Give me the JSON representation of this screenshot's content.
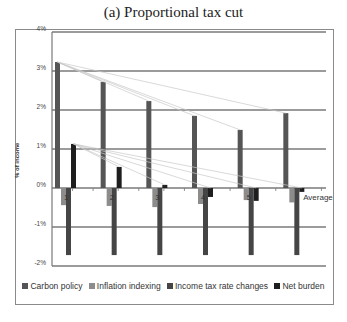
{
  "chart_data": {
    "type": "bar",
    "title": "(a) Proportional tax cut",
    "xlabel": "",
    "ylabel": "% of income",
    "ylim": [
      -0.02,
      0.04
    ],
    "yticks": [
      "4%",
      "3%",
      "2%",
      "1%",
      "0%",
      "-1%",
      "-2%"
    ],
    "ytick_values": [
      0.04,
      0.03,
      0.02,
      0.01,
      0.0,
      -0.01,
      -0.02
    ],
    "grid": true,
    "legend_position": "bottom",
    "categories": [
      "1",
      "2",
      "3",
      "4",
      "5",
      "Average"
    ],
    "series": [
      {
        "name": "Carbon policy",
        "color": "#555555",
        "values": [
          0.0323,
          0.0272,
          0.0223,
          0.0185,
          0.0149,
          0.0192
        ]
      },
      {
        "name": "Inflation indexing",
        "color": "#8c8c8c",
        "values": [
          -0.0044,
          -0.0046,
          -0.0049,
          -0.0041,
          -0.0031,
          -0.0037
        ]
      },
      {
        "name": "Income tax rate changes",
        "color": "#454545",
        "values": [
          -0.0172,
          -0.0172,
          -0.0172,
          -0.0172,
          -0.0172,
          -0.0172
        ]
      },
      {
        "name": "Net burden",
        "color": "#1e1e1e",
        "values": [
          0.0113,
          0.0054,
          0.0008,
          -0.0023,
          -0.0033,
          -0.001
        ]
      }
    ]
  },
  "title": "(a) Proportional tax cut",
  "ylabel": "% of income",
  "legend": [
    {
      "label": "Carbon policy",
      "color": "#555555"
    },
    {
      "label": "Inflation indexing",
      "color": "#8c8c8c"
    },
    {
      "label": "Income tax rate changes",
      "color": "#454545"
    },
    {
      "label": "Net burden",
      "color": "#1e1e1e"
    }
  ]
}
